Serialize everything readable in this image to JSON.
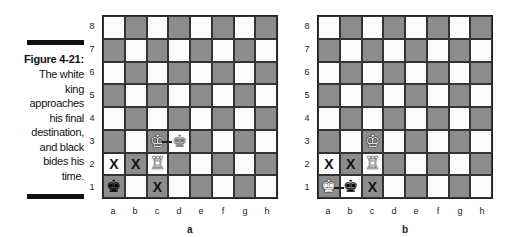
{
  "caption": {
    "label": "Figure 4-21:",
    "lines": [
      "The white",
      "king",
      "approaches",
      "his final",
      "destination,",
      "and black",
      "bides his",
      "time."
    ]
  },
  "colors": {
    "light_square": "#fcfcfc",
    "dark_square": "#8c8c8c",
    "rule": "#111111"
  },
  "files": [
    "a",
    "b",
    "c",
    "d",
    "e",
    "f",
    "g",
    "h"
  ],
  "ranks": [
    "8",
    "7",
    "6",
    "5",
    "4",
    "3",
    "2",
    "1"
  ],
  "boards": [
    {
      "id": "a",
      "label": "a",
      "pieces": [
        {
          "square": "c3",
          "piece": "white-king",
          "glyph": "♔"
        },
        {
          "square": "d3",
          "piece": "ghost-king",
          "glyph": "♚"
        },
        {
          "square": "c2",
          "piece": "white-rook",
          "glyph": "♖"
        },
        {
          "square": "a1",
          "piece": "black-king",
          "glyph": "♚"
        }
      ],
      "marks": [
        {
          "square": "a2",
          "glyph": "X"
        },
        {
          "square": "b2",
          "glyph": "X"
        },
        {
          "square": "c1",
          "glyph": "X"
        }
      ],
      "arrow": {
        "from": "c3",
        "to": "d3"
      }
    },
    {
      "id": "b",
      "label": "b",
      "pieces": [
        {
          "square": "c3",
          "piece": "white-king",
          "glyph": "♔"
        },
        {
          "square": "c2",
          "piece": "white-rook",
          "glyph": "♖"
        },
        {
          "square": "a1",
          "piece": "ghost-king",
          "glyph": "♚"
        },
        {
          "square": "b1",
          "piece": "black-king",
          "glyph": "♚"
        }
      ],
      "marks": [
        {
          "square": "a2",
          "glyph": "X"
        },
        {
          "square": "b2",
          "glyph": "X"
        },
        {
          "square": "c1",
          "glyph": "X"
        }
      ],
      "arrow": {
        "from": "a1",
        "to": "b1"
      }
    }
  ]
}
